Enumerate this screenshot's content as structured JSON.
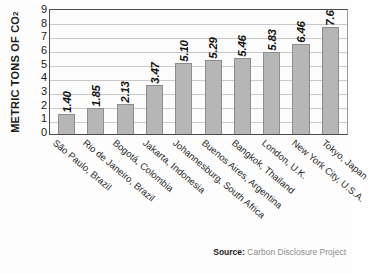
{
  "chart_data": {
    "type": "bar",
    "title": "",
    "xlabel": "",
    "ylabel": "METRIC TONS OF CO2",
    "ylabel_prefix": "METRIC TONS OF CO",
    "ylabel_subscript": "2",
    "ylim": [
      0,
      9
    ],
    "yticks": [
      9,
      8,
      7,
      6,
      5,
      4,
      3,
      2,
      1,
      0
    ],
    "grid": true,
    "legend": "none",
    "categories": [
      "São Paulo, Brazil",
      "Rio de Janeiro, Brazil",
      "Bogotá, Colombia",
      "Jakarta, Indonesia",
      "Johannesburg, South Africa",
      "Buenos Aires, Argentina",
      "Bangkok, Thailand",
      "London, U.K.",
      "New York City, U.S.A.",
      "Tokyo, Japan"
    ],
    "values": [
      1.4,
      1.85,
      2.13,
      3.47,
      5.1,
      5.29,
      5.46,
      5.83,
      6.46,
      7.65
    ],
    "value_labels": [
      "1.40",
      "1.85",
      "2.13",
      "3.47",
      "5.10",
      "5.29",
      "5.46",
      "5.83",
      "6.46",
      "7.65"
    ],
    "bar_color": "#b6b6b6",
    "bar_border_color": "#8d8d8d",
    "plot_background": "#fcfcfc",
    "gridline_color": "#c9c9c9",
    "axis_color": "#4a4a4a"
  },
  "source": {
    "label": "Source:",
    "text": "Carbon Disclosure Project"
  }
}
